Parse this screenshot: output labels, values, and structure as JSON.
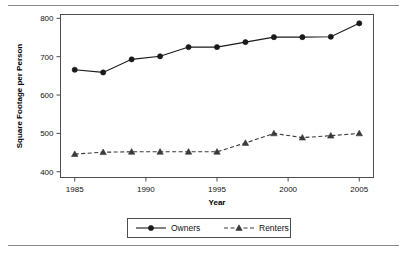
{
  "chart_data": {
    "type": "line",
    "title": "",
    "xlabel": "Year",
    "ylabel": "Square Footage per Person",
    "x": [
      1985,
      1987,
      1989,
      1991,
      1993,
      1995,
      1997,
      1999,
      2001,
      2003,
      2005
    ],
    "xlim": [
      1984,
      2006
    ],
    "ylim": [
      385,
      810
    ],
    "xticks": [
      1985,
      1990,
      1995,
      2000,
      2005
    ],
    "xticklabels": [
      "1985",
      "1990",
      "1995",
      "2000",
      "2005"
    ],
    "yticks": [
      400,
      500,
      600,
      700,
      800
    ],
    "yticklabels": [
      "400",
      "500",
      "600",
      "700",
      "800"
    ],
    "grid": false,
    "legend_position": "below",
    "series": [
      {
        "name": "Owners",
        "marker": "circle",
        "linestyle": "solid",
        "color": "#1a1a1a",
        "values": [
          666,
          659,
          693,
          701,
          725,
          725,
          738,
          751,
          751,
          752,
          787
        ]
      },
      {
        "name": "Renters",
        "marker": "triangle",
        "linestyle": "dashed",
        "color": "#3a3a3a",
        "values": [
          446,
          451,
          452,
          452,
          452,
          452,
          475,
          500,
          489,
          494,
          500
        ]
      }
    ]
  },
  "legend": {
    "items": [
      {
        "label": "Owners"
      },
      {
        "label": "Renters"
      }
    ]
  },
  "axes": {
    "y_axis_title": "Square Footage per Person",
    "x_axis_title": "Year"
  },
  "colors": {
    "frame": "#4d4d4d",
    "owners": "#1a1a1a",
    "renters": "#3a3a3a",
    "rule": "#8a8a8a",
    "text": "#111111"
  }
}
